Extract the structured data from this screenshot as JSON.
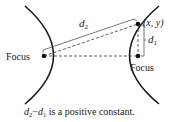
{
  "diagram": {
    "type": "hyperbola-definition",
    "labels": {
      "left_focus": "Focus",
      "right_focus": "Focus",
      "point": "(x, y)",
      "d2_main": "d",
      "d2_sub": "2",
      "d1_main": "d",
      "d1_sub": "1"
    },
    "caption": {
      "d2": "d",
      "d2_sub": "2",
      "minus": "−",
      "d1": "d",
      "d1_sub": "1",
      "rest": " is a positive constant."
    },
    "colors": {
      "stroke": "#1a1a1a",
      "background": "#ffffff"
    }
  }
}
